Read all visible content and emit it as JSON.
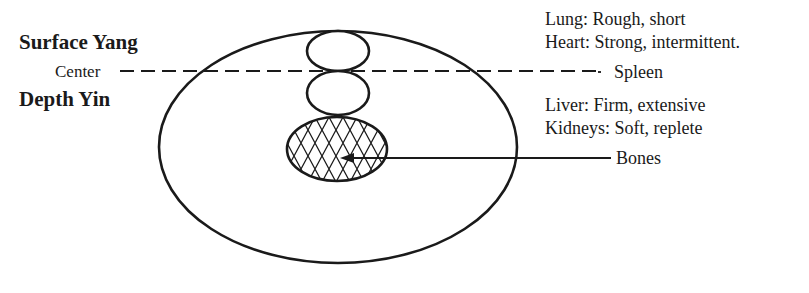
{
  "left_labels": {
    "surface": "Surface Yang",
    "center": "Center",
    "depth": "Depth Yin"
  },
  "right_labels": {
    "lung": "Lung:  Rough, short",
    "heart": "Heart:  Strong, intermittent.",
    "spleen": "Spleen",
    "liver": "Liver:  Firm, extensive",
    "kidneys": "Kidneys:  Soft, replete",
    "bones": "Bones"
  },
  "colors": {
    "stroke": "#1a1a1a",
    "background": "#ffffff"
  }
}
